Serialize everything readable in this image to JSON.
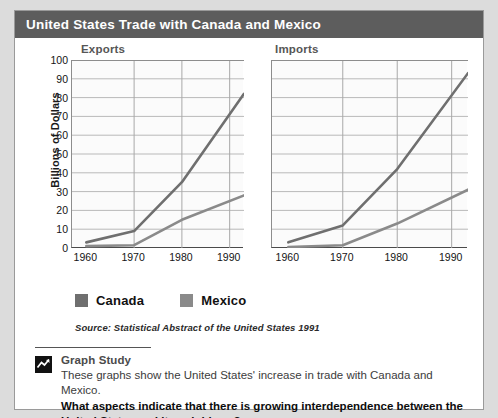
{
  "header": {
    "title": "United States Trade with Canada and Mexico"
  },
  "legend": {
    "items": [
      {
        "label": "Canada",
        "color": "#6f6f6f"
      },
      {
        "label": "Mexico",
        "color": "#8a8a8a"
      }
    ]
  },
  "source_note": "Source: Statistical Abstract of the United States 1991",
  "caption": {
    "heading": "Graph Study",
    "icon": "line-chart-icon",
    "description": "These graphs show the United States' increase in trade with Canada and Mexico.",
    "question": "What aspects indicate that there is growing interdependence between the United States and its neighbors?"
  },
  "chart_data": [
    {
      "type": "line",
      "title": "Exports",
      "xlabel": "",
      "ylabel": "Billions of Dollars",
      "x": [
        1960,
        1970,
        1980,
        1993
      ],
      "xticks": [
        "1960",
        "1970",
        "1980",
        "1990"
      ],
      "xtick_values": [
        1960,
        1970,
        1980,
        1990
      ],
      "yticks": [
        "0",
        "10",
        "20",
        "30",
        "40",
        "50",
        "60",
        "70",
        "80",
        "90",
        "100"
      ],
      "ylim": [
        0,
        100
      ],
      "xlim": [
        1957,
        1993
      ],
      "grid": true,
      "legend_position": "below",
      "series": [
        {
          "name": "Canada",
          "color": "#6f6f6f",
          "values": [
            3,
            9,
            35,
            82
          ]
        },
        {
          "name": "Mexico",
          "color": "#8a8a8a",
          "values": [
            1,
            1.5,
            15,
            28
          ]
        }
      ]
    },
    {
      "type": "line",
      "title": "Imports",
      "xlabel": "",
      "ylabel": "",
      "x": [
        1960,
        1970,
        1980,
        1993
      ],
      "xticks": [
        "1960",
        "1970",
        "1980",
        "1990"
      ],
      "xtick_values": [
        1960,
        1970,
        1980,
        1990
      ],
      "yticks": [
        "0",
        "10",
        "20",
        "30",
        "40",
        "50",
        "60",
        "70",
        "80",
        "90",
        "100"
      ],
      "ylim": [
        0,
        100
      ],
      "xlim": [
        1957,
        1993
      ],
      "grid": true,
      "legend_position": "below",
      "series": [
        {
          "name": "Canada",
          "color": "#6f6f6f",
          "values": [
            3,
            12,
            42,
            93
          ]
        },
        {
          "name": "Mexico",
          "color": "#8a8a8a",
          "values": [
            0.5,
            1.5,
            13,
            31
          ]
        }
      ]
    }
  ]
}
